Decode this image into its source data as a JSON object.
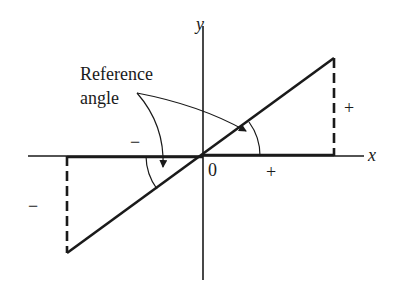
{
  "diagram": {
    "title": "",
    "axes": {
      "x_label": "x",
      "y_label": "y",
      "origin_label": "0"
    },
    "annotation": {
      "line1": "Reference",
      "line2": "angle"
    },
    "signs": {
      "x_positive": "+",
      "x_negative": "−",
      "y_positive": "+",
      "y_negative": "−"
    },
    "colors": {
      "ink": "#1a1a1a",
      "background": "#ffffff"
    }
  }
}
